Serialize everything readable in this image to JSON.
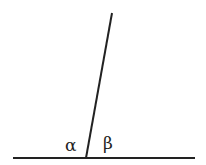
{
  "diagram": {
    "type": "angles on a straight line",
    "line_color": "#222222",
    "baseline": {
      "x1": 13,
      "y1": 158,
      "x2": 195,
      "y2": 158
    },
    "transversal": {
      "x1": 112,
      "y1": 13,
      "x2": 86,
      "y2": 158
    },
    "labels": {
      "alpha": "α",
      "beta": "β"
    }
  }
}
